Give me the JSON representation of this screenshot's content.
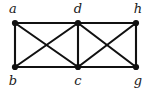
{
  "figure": {
    "kind": "undirected-graph-diagram",
    "background_color": "#ffffff",
    "ink_color": "#111111",
    "label_color": "#1a1a1a",
    "width": 148,
    "height": 89
  },
  "graph_data": {
    "type": "graph",
    "directed": false,
    "vertex_count": 6,
    "edge_count": 11,
    "vertices": [
      {
        "id": "a",
        "label": "a",
        "x": 15,
        "y": 23,
        "label_x": 13,
        "label_y": 13,
        "label_position": "above-left"
      },
      {
        "id": "d",
        "label": "d",
        "x": 78,
        "y": 23,
        "label_x": 78,
        "label_y": 13,
        "label_position": "above"
      },
      {
        "id": "h",
        "label": "h",
        "x": 136,
        "y": 23,
        "label_x": 138,
        "label_y": 13,
        "label_position": "above-right"
      },
      {
        "id": "b",
        "label": "b",
        "x": 15,
        "y": 67,
        "label_x": 13,
        "label_y": 85,
        "label_position": "below-left"
      },
      {
        "id": "c",
        "label": "c",
        "x": 78,
        "y": 67,
        "label_x": 78,
        "label_y": 85,
        "label_position": "below"
      },
      {
        "id": "g",
        "label": "g",
        "x": 136,
        "y": 67,
        "label_x": 138,
        "label_y": 85,
        "label_position": "below-right"
      }
    ],
    "edges": [
      {
        "id": "a-d",
        "source": "a",
        "target": "d",
        "x1": 15,
        "y1": 23,
        "x2": 78,
        "y2": 23,
        "kind": "top-horizontal"
      },
      {
        "id": "d-h",
        "source": "d",
        "target": "h",
        "x1": 78,
        "y1": 23,
        "x2": 136,
        "y2": 23,
        "kind": "top-horizontal"
      },
      {
        "id": "b-c",
        "source": "b",
        "target": "c",
        "x1": 15,
        "y1": 67,
        "x2": 78,
        "y2": 67,
        "kind": "bottom-horizontal"
      },
      {
        "id": "c-g",
        "source": "c",
        "target": "g",
        "x1": 78,
        "y1": 67,
        "x2": 136,
        "y2": 67,
        "kind": "bottom-horizontal"
      },
      {
        "id": "a-b",
        "source": "a",
        "target": "b",
        "x1": 15,
        "y1": 23,
        "x2": 15,
        "y2": 67,
        "kind": "vertical"
      },
      {
        "id": "d-c",
        "source": "d",
        "target": "c",
        "x1": 78,
        "y1": 23,
        "x2": 78,
        "y2": 67,
        "kind": "vertical"
      },
      {
        "id": "h-g",
        "source": "h",
        "target": "g",
        "x1": 136,
        "y1": 23,
        "x2": 136,
        "y2": 67,
        "kind": "vertical"
      },
      {
        "id": "a-c",
        "source": "a",
        "target": "c",
        "x1": 15,
        "y1": 23,
        "x2": 78,
        "y2": 67,
        "kind": "diagonal"
      },
      {
        "id": "d-b",
        "source": "d",
        "target": "b",
        "x1": 78,
        "y1": 23,
        "x2": 15,
        "y2": 67,
        "kind": "diagonal"
      },
      {
        "id": "d-g",
        "source": "d",
        "target": "g",
        "x1": 78,
        "y1": 23,
        "x2": 136,
        "y2": 67,
        "kind": "diagonal"
      },
      {
        "id": "h-c",
        "source": "h",
        "target": "c",
        "x1": 136,
        "y1": 23,
        "x2": 78,
        "y2": 67,
        "kind": "diagonal"
      }
    ],
    "vertex_radius": 3.1,
    "edge_stroke_width": 2.1
  }
}
